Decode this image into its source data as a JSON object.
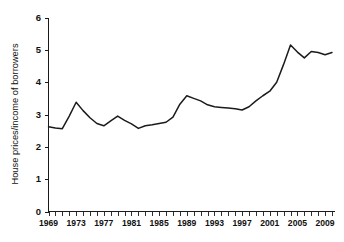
{
  "chart_data": {
    "type": "line",
    "title": "",
    "subtitle": "",
    "xlabel": "",
    "ylabel": "House prices/income of borrowers",
    "xlim": [
      1969,
      2010
    ],
    "ylim": [
      0,
      6
    ],
    "grid": false,
    "legend": false,
    "legend_position": "none",
    "y_ticks": [
      "0",
      "1",
      "2",
      "3",
      "4",
      "5",
      "6"
    ],
    "x_ticks": [
      "1969",
      "1973",
      "1977",
      "1981",
      "1985",
      "1989",
      "1993",
      "1997",
      "2001",
      "2005",
      "2009"
    ],
    "x_minor_tick_interval": 1,
    "line_color": "#1b1b1b",
    "background_color": "#ffffff",
    "series": [
      {
        "name": "House prices/income of borrowers",
        "x": [
          1969,
          1970,
          1971,
          1972,
          1973,
          1974,
          1975,
          1976,
          1977,
          1978,
          1979,
          1980,
          1981,
          1982,
          1983,
          1984,
          1985,
          1986,
          1987,
          1988,
          1989,
          1990,
          1991,
          1992,
          1993,
          1994,
          1995,
          1996,
          1997,
          1998,
          1999,
          2000,
          2001,
          2002,
          2003,
          2004,
          2005,
          2006,
          2007,
          2008,
          2009,
          2010
        ],
        "values": [
          2.62,
          2.58,
          2.56,
          2.95,
          3.38,
          3.12,
          2.9,
          2.72,
          2.65,
          2.8,
          2.95,
          2.82,
          2.71,
          2.57,
          2.65,
          2.68,
          2.72,
          2.76,
          2.92,
          3.32,
          3.58,
          3.5,
          3.42,
          3.3,
          3.24,
          3.22,
          3.2,
          3.18,
          3.14,
          3.24,
          3.42,
          3.58,
          3.72,
          4.0,
          4.55,
          5.15,
          4.93,
          4.75,
          4.95,
          4.92,
          4.85,
          4.92
        ]
      }
    ]
  },
  "axes": {
    "y_axis_label": "House prices/income of borrowers"
  }
}
